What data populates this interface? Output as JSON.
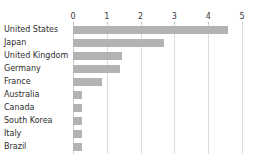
{
  "chart_data": {
    "type": "bar",
    "orientation": "horizontal",
    "title": "",
    "subtitle": "",
    "xlabel": "",
    "ylabel": "",
    "categories": [
      "United States",
      "Japan",
      "United Kingdom",
      "Germany",
      "France",
      "Australia",
      "Canada",
      "South Korea",
      "Italy",
      "Brazil"
    ],
    "values": [
      4.6,
      2.7,
      1.45,
      1.4,
      0.85,
      0.28,
      0.28,
      0.28,
      0.28,
      0.26
    ],
    "xlim": [
      0,
      5
    ],
    "xticks": [
      0,
      1,
      2,
      3,
      4,
      5
    ],
    "xtick_labels": [
      "0",
      "1",
      "2",
      "3",
      "4",
      "5"
    ],
    "grid": true,
    "grid_axis": "x",
    "legend": false,
    "legend_position": "none",
    "bar_color": "#b3b3b3",
    "gridline_color": "#dcdcdc",
    "axis_label_color": "#3a3a3a",
    "category_label_color": "#2d2d2d",
    "background_color": "#ffffff"
  }
}
